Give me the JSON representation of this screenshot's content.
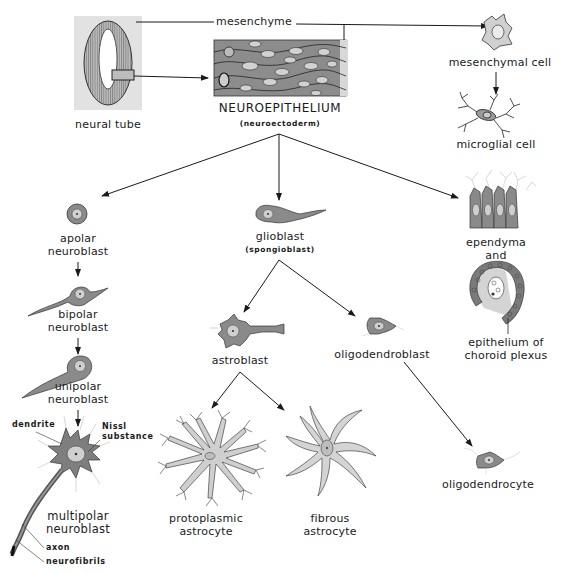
{
  "diagram": {
    "topic": "Histogenesis of neural tube derivatives",
    "colors": {
      "cell_fill": "#8a8a8a",
      "cell_outline": "#2a2a2a",
      "nucleus_fill": "#cfcfcf",
      "light_fill": "#c8c8c8",
      "neural_tube_bg": "#e2e2e2",
      "arrow": "#1a1a1a",
      "background": "#ffffff"
    },
    "nodes": {
      "neural_tube": {
        "label": "neural tube"
      },
      "neuroepithelium": {
        "label": "NEUROEPITHELIUM",
        "sublabel": "(neuroectoderm)"
      },
      "mesenchyme": {
        "label": "mesenchyme"
      },
      "mesenchymal_cell": {
        "label": "mesenchymal cell"
      },
      "microglial_cell": {
        "label": "microglial cell"
      },
      "apolar_neuroblast": {
        "line1": "apolar",
        "line2": "neuroblast"
      },
      "bipolar_neuroblast": {
        "line1": "bipolar",
        "line2": "neuroblast"
      },
      "unipolar_neuroblast": {
        "line1": "unipolar",
        "line2": "neuroblast"
      },
      "multipolar_neuroblast": {
        "line1": "multipolar",
        "line2": "neuroblast"
      },
      "glioblast": {
        "label": "glioblast",
        "sublabel": "(spongioblast)"
      },
      "astroblast": {
        "label": "astroblast"
      },
      "oligodendroblast": {
        "label": "oligodendroblast"
      },
      "protoplasmic_astrocyte": {
        "line1": "protoplasmic",
        "line2": "astrocyte"
      },
      "fibrous_astrocyte": {
        "line1": "fibrous",
        "line2": "astrocyte"
      },
      "oligodendrocyte": {
        "label": "oligodendrocyte"
      },
      "ependyma": {
        "line1": "ependyma",
        "line2": "and"
      },
      "choroid_plexus": {
        "line1": "epithelium of",
        "line2": "choroid plexus"
      }
    },
    "annotations": {
      "dendrite": "dendrite",
      "nissl_line1": "Nissl",
      "nissl_line2": "substance",
      "axon": "axon",
      "neurofibrils": "neurofibrils"
    },
    "edges": [
      {
        "from": "neural_tube",
        "to": "neuroepithelium"
      },
      {
        "from": "neural_tube",
        "to": "mesenchymal_cell",
        "via": "mesenchyme"
      },
      {
        "from": "mesenchymal_cell",
        "to": "microglial_cell"
      },
      {
        "from": "neuroepithelium",
        "to": "apolar_neuroblast"
      },
      {
        "from": "neuroepithelium",
        "to": "glioblast"
      },
      {
        "from": "neuroepithelium",
        "to": "ependyma"
      },
      {
        "from": "apolar_neuroblast",
        "to": "bipolar_neuroblast"
      },
      {
        "from": "bipolar_neuroblast",
        "to": "unipolar_neuroblast"
      },
      {
        "from": "unipolar_neuroblast",
        "to": "multipolar_neuroblast"
      },
      {
        "from": "glioblast",
        "to": "astroblast"
      },
      {
        "from": "glioblast",
        "to": "oligodendroblast"
      },
      {
        "from": "astroblast",
        "to": "protoplasmic_astrocyte"
      },
      {
        "from": "astroblast",
        "to": "fibrous_astrocyte"
      },
      {
        "from": "oligodendroblast",
        "to": "oligodendrocyte"
      }
    ]
  }
}
